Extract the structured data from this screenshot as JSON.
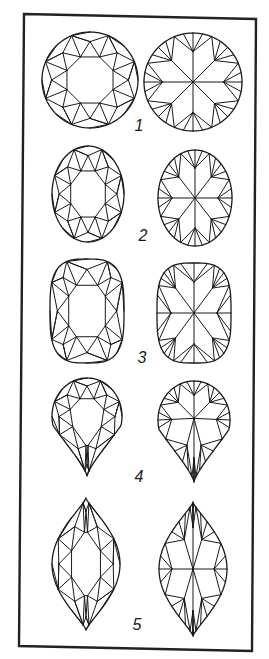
{
  "figure": {
    "width": 269,
    "height": 659,
    "background": "#ffffff",
    "ink_color": "#1a1a1a",
    "frame": {
      "points": [
        [
          24,
          14
        ],
        [
          256,
          19
        ],
        [
          252,
          651
        ],
        [
          19,
          646
        ]
      ]
    },
    "rows": [
      {
        "number": "1",
        "cut": "round-brilliant",
        "label_pos": [
          139,
          131
        ],
        "crown": {
          "shape": "round",
          "cx": 90,
          "cy": 80,
          "rx": 48,
          "ry": 48
        },
        "pavilion": {
          "shape": "round",
          "cx": 193,
          "cy": 82,
          "rx": 49,
          "ry": 49
        }
      },
      {
        "number": "2",
        "cut": "oval",
        "label_pos": [
          143,
          241
        ],
        "crown": {
          "shape": "oval",
          "cx": 88,
          "cy": 194,
          "rx": 36,
          "ry": 48
        },
        "pavilion": {
          "shape": "oval",
          "cx": 195,
          "cy": 198,
          "rx": 37,
          "ry": 48
        }
      },
      {
        "number": "3",
        "cut": "cushion",
        "label_pos": [
          142,
          363
        ],
        "crown": {
          "shape": "cushion",
          "cx": 87,
          "cy": 311,
          "rx": 37,
          "ry": 52
        },
        "pavilion": {
          "shape": "cushion",
          "cx": 194,
          "cy": 313,
          "rx": 37,
          "ry": 50
        }
      },
      {
        "number": "4",
        "cut": "pear",
        "label_pos": [
          139,
          482
        ],
        "crown": {
          "shape": "pear",
          "cx": 87,
          "cy": 418,
          "rx": 35,
          "ry": 49,
          "top": 378,
          "bottom": 476
        },
        "pavilion": {
          "shape": "pear",
          "cx": 194,
          "cy": 420,
          "rx": 36,
          "ry": 50,
          "top": 381,
          "bottom": 482
        }
      },
      {
        "number": "5",
        "cut": "marquise",
        "label_pos": [
          137,
          630
        ],
        "crown": {
          "shape": "marquise",
          "cx": 86,
          "cy": 564,
          "rx": 34,
          "ry": 66
        },
        "pavilion": {
          "shape": "marquise",
          "cx": 193,
          "cy": 569,
          "rx": 34,
          "ry": 67
        }
      }
    ],
    "views": [
      "crown (top view)",
      "pavilion (bottom view)"
    ]
  }
}
